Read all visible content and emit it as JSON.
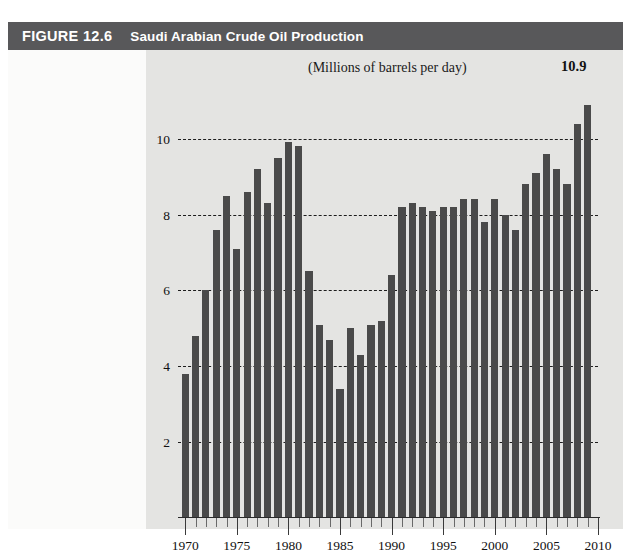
{
  "figure": {
    "number": "FIGURE 12.6",
    "title": "Saudi Arabian Crude Oil Production",
    "header_color": "#58585a",
    "panel_color": "#e4e4e2",
    "bar_color": "#4a4a4a"
  },
  "chart_data": {
    "type": "bar",
    "title": "Saudi Arabian Crude Oil Production",
    "subtitle": "(Millions of barrels per day)",
    "xlabel": "",
    "ylabel": "",
    "ylim": [
      0,
      11.6
    ],
    "xlim": [
      1969.3,
      2010
    ],
    "yticks": [
      2,
      4,
      6,
      8,
      10
    ],
    "ytick_labels": [
      "2",
      "4",
      "6",
      "8",
      "10"
    ],
    "xticks": [
      1970,
      1975,
      1980,
      1985,
      1990,
      1995,
      2000,
      2005,
      2010
    ],
    "xtick_labels": [
      "1970",
      "1975",
      "1980",
      "1985",
      "1990",
      "1995",
      "2000",
      "2005",
      "2010"
    ],
    "grid": "horizontal-dashed",
    "legend": "none",
    "annotations": [
      {
        "text": "10.9",
        "x": 2009,
        "y": 10.9
      }
    ],
    "categories": [
      1970,
      1971,
      1972,
      1973,
      1974,
      1975,
      1976,
      1977,
      1978,
      1979,
      1980,
      1981,
      1982,
      1983,
      1984,
      1985,
      1986,
      1987,
      1988,
      1989,
      1990,
      1991,
      1992,
      1993,
      1994,
      1995,
      1996,
      1997,
      1998,
      1999,
      2000,
      2001,
      2002,
      2003,
      2004,
      2005,
      2006,
      2007,
      2008,
      2009
    ],
    "values": [
      3.8,
      4.8,
      6.0,
      7.6,
      8.5,
      7.1,
      8.6,
      9.2,
      8.3,
      9.5,
      9.9,
      9.8,
      6.5,
      5.1,
      4.7,
      3.4,
      5.0,
      4.3,
      5.1,
      5.2,
      6.4,
      8.2,
      8.3,
      8.2,
      8.1,
      8.2,
      8.2,
      8.4,
      8.4,
      7.8,
      8.4,
      8.0,
      7.6,
      8.8,
      9.1,
      9.6,
      9.2,
      8.8,
      10.4,
      10.9
    ]
  }
}
